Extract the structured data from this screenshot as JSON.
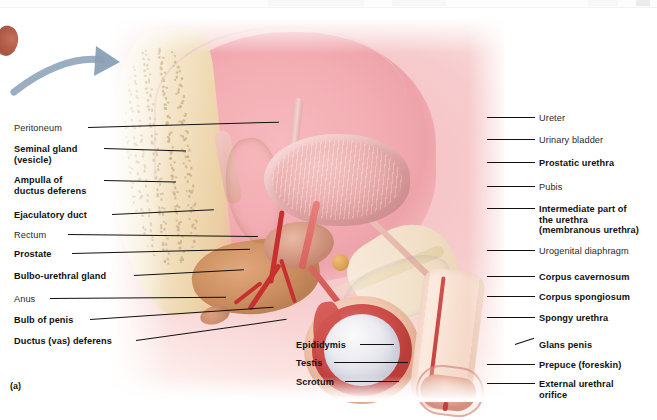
{
  "figure": {
    "caption": "(a)"
  },
  "arrow": {
    "name": "orientation-arrow",
    "color": "#8fa3b8",
    "direction": "right"
  },
  "labels_left": [
    {
      "text": "Peritoneum",
      "weight": "regular",
      "x": 14,
      "y": 123,
      "leader_x": 88,
      "leader_y": 127,
      "leader_len": 191,
      "leader_angle": -1.6
    },
    {
      "text": "Seminal gland\n(vesicle)",
      "weight": "bold",
      "x": 14,
      "y": 144,
      "leader_x": 104,
      "leader_y": 148,
      "leader_len": 82,
      "leader_angle": 1.8
    },
    {
      "text": "Ampulla of\nductus deferens",
      "weight": "bold",
      "x": 14,
      "y": 175,
      "leader_x": 104,
      "leader_y": 180,
      "leader_len": 72,
      "leader_angle": 1.2
    },
    {
      "text": "Ejaculatory duct",
      "weight": "bold",
      "x": 14,
      "y": 210,
      "leader_x": 112,
      "leader_y": 214,
      "leader_len": 102,
      "leader_angle": -2.6
    },
    {
      "text": "Rectum",
      "weight": "regular",
      "x": 14,
      "y": 230,
      "leader_x": 68,
      "leader_y": 234,
      "leader_len": 190,
      "leader_angle": 0.6
    },
    {
      "text": "Prostate",
      "weight": "bold",
      "x": 14,
      "y": 249,
      "leader_x": 72,
      "leader_y": 253,
      "leader_len": 178,
      "leader_angle": -1.4
    },
    {
      "text": "Bulbo-urethral gland",
      "weight": "bold",
      "x": 14,
      "y": 271,
      "leader_x": 134,
      "leader_y": 275,
      "leader_len": 110,
      "leader_angle": -3.0
    },
    {
      "text": "Anus",
      "weight": "regular",
      "x": 14,
      "y": 294,
      "leader_x": 50,
      "leader_y": 298,
      "leader_len": 176,
      "leader_angle": -0.4
    },
    {
      "text": "Bulb of penis",
      "weight": "bold",
      "x": 14,
      "y": 315,
      "leader_x": 90,
      "leader_y": 319,
      "leader_len": 184,
      "leader_angle": -3.8
    },
    {
      "text": "Ductus (vas) deferens",
      "weight": "bold",
      "x": 14,
      "y": 336,
      "leader_x": 136,
      "leader_y": 340,
      "leader_len": 152,
      "leader_angle": -8.0
    }
  ],
  "labels_right": [
    {
      "text": "Ureter",
      "weight": "regular",
      "x": 539,
      "y": 113,
      "leader_x": 487,
      "leader_y": 117,
      "leader_len": 48,
      "leader_angle": 0.0
    },
    {
      "text": "Urinary bladder",
      "weight": "regular",
      "x": 539,
      "y": 135,
      "leader_x": 487,
      "leader_y": 139,
      "leader_len": 48,
      "leader_angle": 0.0
    },
    {
      "text": "Prostatic urethra",
      "weight": "bold",
      "x": 539,
      "y": 158,
      "leader_x": 487,
      "leader_y": 162,
      "leader_len": 48,
      "leader_angle": 0.0
    },
    {
      "text": "Pubis",
      "weight": "regular",
      "x": 539,
      "y": 182,
      "leader_x": 487,
      "leader_y": 186,
      "leader_len": 48,
      "leader_angle": 0.0
    },
    {
      "text": "Intermediate part of\nthe urethra\n(membranous urethra)",
      "weight": "bold",
      "x": 539,
      "y": 204,
      "leader_x": 487,
      "leader_y": 208,
      "leader_len": 48,
      "leader_angle": 0.0
    },
    {
      "text": "Urogenital diaphragm",
      "weight": "regular",
      "x": 539,
      "y": 246,
      "leader_x": 487,
      "leader_y": 250,
      "leader_len": 48,
      "leader_angle": 0.0
    },
    {
      "text": "Corpus cavernosum",
      "weight": "bold",
      "x": 539,
      "y": 272,
      "leader_x": 487,
      "leader_y": 276,
      "leader_len": 48,
      "leader_angle": 0.0
    },
    {
      "text": "Corpus spongiosum",
      "weight": "bold",
      "x": 539,
      "y": 292,
      "leader_x": 487,
      "leader_y": 296,
      "leader_len": 48,
      "leader_angle": 0.0
    },
    {
      "text": "Spongy urethra",
      "weight": "bold",
      "x": 539,
      "y": 313,
      "leader_x": 487,
      "leader_y": 317,
      "leader_len": 48,
      "leader_angle": 0.0
    },
    {
      "text": "Glans penis",
      "weight": "bold",
      "x": 539,
      "y": 340,
      "leader_x": 515,
      "leader_y": 344,
      "leader_len": 20,
      "leader_angle": -18.0
    },
    {
      "text": "Prepuce (foreskin)",
      "weight": "bold",
      "x": 539,
      "y": 360,
      "leader_x": 487,
      "leader_y": 364,
      "leader_len": 48,
      "leader_angle": 0.0
    },
    {
      "text": "External urethral\norifice",
      "weight": "bold",
      "x": 539,
      "y": 379,
      "leader_x": 487,
      "leader_y": 383,
      "leader_len": 48,
      "leader_angle": 0.0
    }
  ],
  "labels_center": [
    {
      "text": "Epididymis",
      "weight": "bold",
      "x": 296,
      "y": 340,
      "leader_x": 360,
      "leader_y": 344,
      "leader_len": 34,
      "leader_angle": 0.0
    },
    {
      "text": "Testis",
      "weight": "bold",
      "x": 296,
      "y": 358,
      "leader_x": 334,
      "leader_y": 362,
      "leader_len": 74,
      "leader_angle": 0.0
    },
    {
      "text": "Scrotum",
      "weight": "bold",
      "x": 296,
      "y": 377,
      "leader_x": 345,
      "leader_y": 381,
      "leader_len": 54,
      "leader_angle": 0.0
    }
  ],
  "colors": {
    "label_text": "#111111",
    "leader_line": "#111111",
    "arrow": "#8fa3b8",
    "background": "#ffffff",
    "erectile_tissue": "#6f7fc0",
    "artery": "#c8302f",
    "seminal_gland": "#d79a58",
    "bone": "#f2e4cb"
  }
}
